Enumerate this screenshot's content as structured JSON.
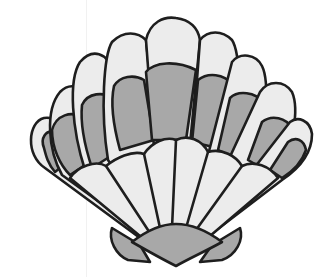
{
  "image": {
    "subject": "scallop seashell clip art",
    "colors": {
      "background": "#ffffff",
      "light_fill": "#ececec",
      "dark_fill": "#a8a8a8",
      "outline": "#1e1e1e"
    },
    "rib_count": 11
  }
}
